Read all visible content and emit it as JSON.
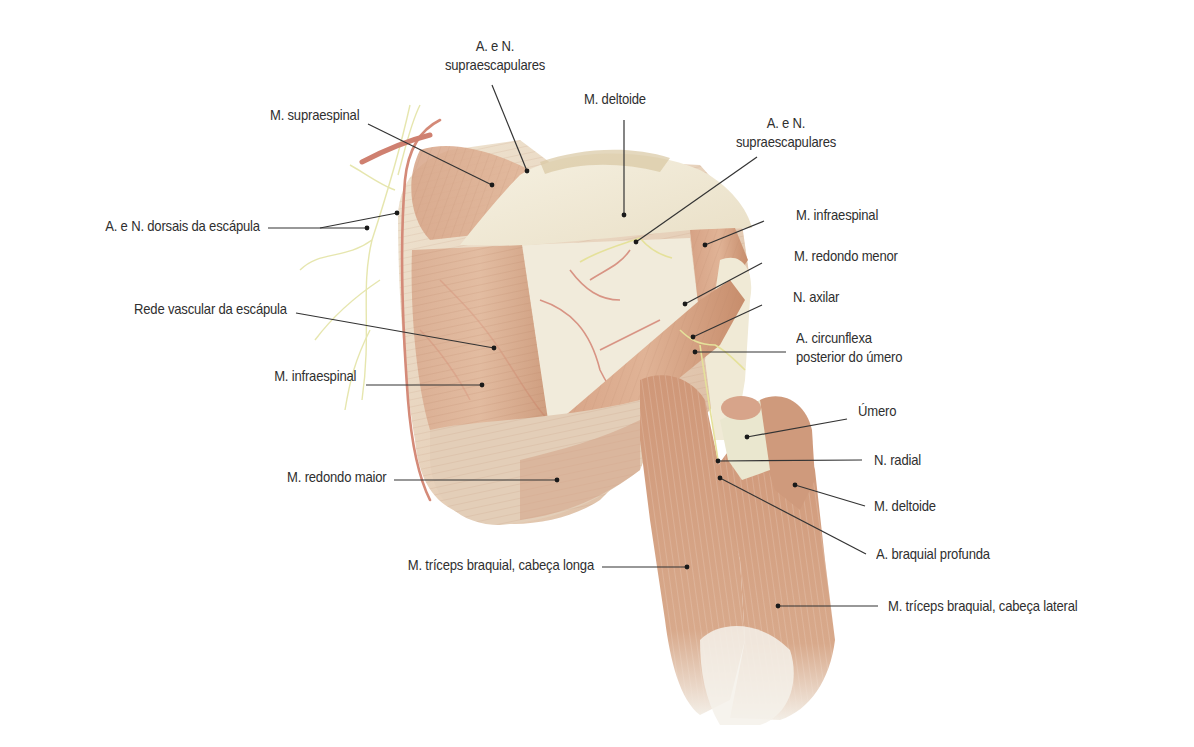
{
  "figure": {
    "colors": {
      "muscle": "#d9a88a",
      "muscle_dark": "#c48a6a",
      "tendon": "#f1ead8",
      "artery": "#d48a78",
      "nerve": "#e7e6a8",
      "leader_line": "#333333",
      "text": "#2f2f2f"
    }
  },
  "labels": {
    "supraescapulares_top": {
      "line1": "A. e N.",
      "line2": "supraescapulares"
    },
    "deltoide_top": "M. deltoide",
    "supraescapulares_right": {
      "line1": "A. e N.",
      "line2": "supraescapulares"
    },
    "supraespinal": "M. supraespinal",
    "dorsais_escapula": "A. e N. dorsais da escápula",
    "infraespinal_right": "M. infraespinal",
    "redondo_menor": "M. redondo menor",
    "axilar": "N. axilar",
    "circunflexa": {
      "line1": "A. circunflexa",
      "line2": "posterior do úmero"
    },
    "rede_vascular": "Rede vascular da escápula",
    "infraespinal_left": "M. infraespinal",
    "umero": "Úmero",
    "radial": "N. radial",
    "redondo_maior": "M. redondo maior",
    "deltoide_right": "M. deltoide",
    "braquial_profunda": "A. braquial profunda",
    "triceps_longa": "M. tríceps braquial, cabeça longa",
    "triceps_lateral": "M. tríceps braquial, cabeça lateral"
  }
}
